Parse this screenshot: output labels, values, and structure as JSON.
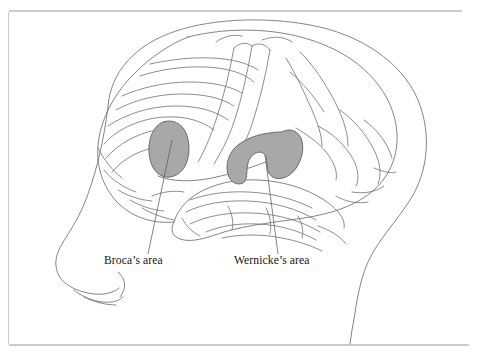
{
  "figure": {
    "view": "left lateral profile inside head silhouette",
    "background_color": "#ffffff",
    "line_color": "#6e6e6e",
    "highlight_color": "#a8a8a8",
    "rule_color": "#9a9a9a"
  },
  "labels": [
    {
      "id": "brocas",
      "text": "Broca’s area",
      "x": 104,
      "y": 264,
      "highlight_color": "#a8a8a8"
    },
    {
      "id": "wernickes",
      "text": "Wernicke’s area",
      "x": 234,
      "y": 264,
      "highlight_color": "#a8a8a8"
    }
  ],
  "regions": [
    {
      "id": "brocas-region",
      "name": "Broca's area",
      "fill": "#a8a8a8",
      "stroke": "#5f5f5f"
    },
    {
      "id": "wernickes-region",
      "name": "Wernicke's area",
      "fill": "#a8a8a8",
      "stroke": "#5f5f5f"
    }
  ],
  "frame": {
    "top_rule": true,
    "bottom_rule": true,
    "left_rule": true,
    "right_rule": false
  }
}
